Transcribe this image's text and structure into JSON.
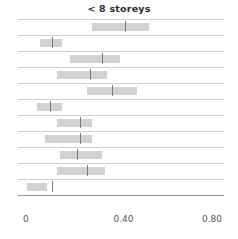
{
  "chart_data": {
    "type": "bar",
    "subtype": "horizontal-interval-dot-plot",
    "title": "< 8 storeys",
    "xlabel": "",
    "ylabel": "",
    "xlim": [
      0,
      0.8
    ],
    "ticks": [
      {
        "label": "0",
        "value": 0
      },
      {
        "label": "0.40",
        "value": 0.4
      },
      {
        "label": "0.80",
        "value": 0.8
      }
    ],
    "grid": true,
    "legend": null,
    "categories": [
      "row-1",
      "row-2",
      "row-3",
      "row-4",
      "row-5",
      "row-6",
      "row-7",
      "row-8",
      "row-9",
      "row-10",
      "row-11"
    ],
    "intervals": [
      {
        "low": 0.27,
        "high": 0.5,
        "median": 0.4
      },
      {
        "low": 0.06,
        "high": 0.15,
        "median": 0.11
      },
      {
        "low": 0.18,
        "high": 0.38,
        "median": 0.31
      },
      {
        "low": 0.13,
        "high": 0.33,
        "median": 0.26
      },
      {
        "low": 0.25,
        "high": 0.45,
        "median": 0.35
      },
      {
        "low": 0.05,
        "high": 0.15,
        "median": 0.1
      },
      {
        "low": 0.13,
        "high": 0.27,
        "median": 0.22
      },
      {
        "low": 0.08,
        "high": 0.27,
        "median": 0.22
      },
      {
        "low": 0.14,
        "high": 0.31,
        "median": 0.21
      },
      {
        "low": 0.13,
        "high": 0.32,
        "median": 0.25
      },
      {
        "low": 0.01,
        "high": 0.09,
        "median": 0.11
      }
    ],
    "colors": {
      "bar": "#d2d2d2",
      "median": "#7d7d7d",
      "grid": "#cfcfcf",
      "axis": "#9a9a9a",
      "title": "#2b2b2b",
      "tick_label": "#555555"
    }
  }
}
